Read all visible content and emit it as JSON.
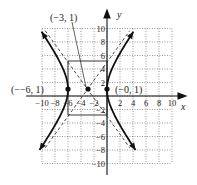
{
  "chart_data": {
    "type": "line",
    "title": "",
    "xlabel": "x",
    "ylabel": "y",
    "xlim": [
      -10,
      10
    ],
    "ylim": [
      -10,
      10
    ],
    "grid": true,
    "x_ticks": [
      "-10",
      "-8",
      "-6",
      "-4",
      "-2",
      "2",
      "4",
      "6",
      "8",
      "10"
    ],
    "y_ticks": [
      "10",
      "8",
      "6",
      "4",
      "2",
      "-2",
      "-4",
      "-6",
      "-8",
      "-10"
    ],
    "series": [
      {
        "name": "hyperbola",
        "equation": "(x+3)^2/9 - (y-1)^2/16 = 1",
        "center": [
          -3,
          1
        ],
        "a": 3,
        "b": 4
      },
      {
        "name": "asymptotes",
        "style": "dashed",
        "lines": [
          "y - 1 = 4/3 (x + 3)",
          "y - 1 = -4/3 (x + 3)"
        ]
      }
    ],
    "points": [
      {
        "label": "(−3, 1)",
        "x": -3,
        "y": 1
      },
      {
        "label": "(−6, 1)",
        "x": -6,
        "y": 1
      },
      {
        "label": "(0, 1)",
        "x": 0,
        "y": 1
      }
    ],
    "rectangle": {
      "x": [
        -6,
        0
      ],
      "y": [
        -3,
        5
      ]
    }
  },
  "labels": {
    "center": "(−3, 1)",
    "left_vertex": "(−−6, 1)",
    "right_vertex": "(−0, 1)",
    "x_axis": "x",
    "y_axis": "y"
  }
}
